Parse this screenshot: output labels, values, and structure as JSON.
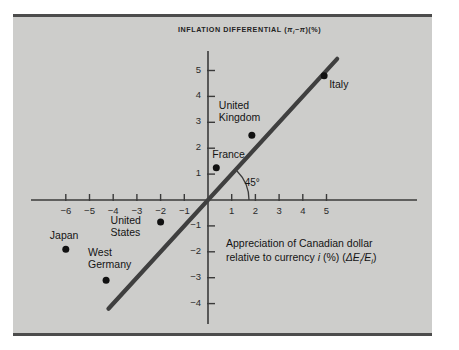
{
  "figure": {
    "background": "#ffffff",
    "panel_color": "#cdcdcb",
    "rule_color": "#4c4c4c",
    "ink_color": "#222222"
  },
  "chart_data": {
    "type": "scatter",
    "title_plain": "INFLATION DIFFERENTIAL",
    "title_symbol_prefix": "(",
    "title_symbol_pi_i": "π",
    "title_symbol_sub_i": "i",
    "title_symbol_minus": "−",
    "title_symbol_pi": "π",
    "title_symbol_suffix": ")(%)",
    "xlabel": "Appreciation of Canadian dollar relative to currency i (%) (ΔEi/Ei)",
    "xlabel_line1": "Appreciation of Canadian dollar",
    "xlabel_line2_a": "relative to currency ",
    "xlabel_line2_i": "i",
    "xlabel_line2_b": " (%) (",
    "xlabel_line2_delta": "ΔE",
    "xlabel_line2_sub1": "i",
    "xlabel_line2_slash": "/E",
    "xlabel_line2_sub2": "i",
    "xlabel_line2_close": ")",
    "ylabel": "Inflation differential (%)",
    "xlim": [
      -7,
      6
    ],
    "ylim": [
      -4.6,
      5.8
    ],
    "xticks": [
      -6,
      -5,
      -4,
      -3,
      -2,
      -1,
      1,
      2,
      3,
      4,
      5
    ],
    "yticks": [
      -4,
      -3,
      -2,
      -1,
      1,
      2,
      3,
      4,
      5
    ],
    "xtick_labels": [
      "−6",
      "−5",
      "−4",
      "−3",
      "−2",
      "−1",
      "1",
      "2",
      "3",
      "4",
      "5"
    ],
    "ytick_labels": [
      "−4",
      "−3",
      "−2",
      "−1",
      "1",
      "2",
      "3",
      "4",
      "5"
    ],
    "grid": false,
    "legend": "none",
    "points": [
      {
        "name": "Japan",
        "label": "Japan",
        "x": -6.0,
        "y": -1.9,
        "label_dx": -16,
        "label_dy": -19,
        "label_align": "left"
      },
      {
        "name": "West Germany",
        "label": "West\nGermany",
        "x": -4.3,
        "y": -3.1,
        "label_dx": -18,
        "label_dy": -33,
        "label_align": "left"
      },
      {
        "name": "United States",
        "label": "United\nStates",
        "x": -2.0,
        "y": -0.85,
        "label_dx": -50,
        "label_dy": -7,
        "label_align": "left"
      },
      {
        "name": "France",
        "label": "France",
        "x": 0.35,
        "y": 1.25,
        "label_dx": -4,
        "label_dy": -19,
        "label_align": "left"
      },
      {
        "name": "United Kingdom",
        "label": "United\nKingdom",
        "x": 1.85,
        "y": 2.5,
        "label_dx": -33,
        "label_dy": -35,
        "label_align": "left"
      },
      {
        "name": "Italy",
        "label": "Italy",
        "x": 4.9,
        "y": 4.8,
        "label_dx": 5,
        "label_dy": 3,
        "label_align": "left"
      }
    ],
    "reference_line": {
      "label": "45°",
      "slope": 1,
      "intercept": 0,
      "x_start": -4.2,
      "x_end": 5.45,
      "angle_label_x": 1.55,
      "angle_label_y": 0.62
    },
    "annotations": [
      {
        "name": "angle-45",
        "text": "45°"
      }
    ]
  }
}
